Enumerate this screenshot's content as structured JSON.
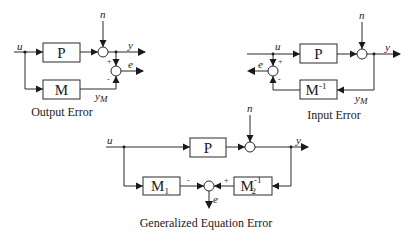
{
  "diagrams": [
    {
      "caption": "Output Error",
      "blocks": {
        "plant": "P",
        "model": "M"
      },
      "signals": {
        "input": "u",
        "noise": "n",
        "output": "y",
        "error": "e",
        "model_output": "y",
        "model_output_sub": "M"
      },
      "signs": {
        "plus": "+",
        "minus": "-"
      }
    },
    {
      "caption": "Input Error",
      "blocks": {
        "plant": "P",
        "inverse_model": "M",
        "inverse_sup": "-1"
      },
      "signals": {
        "input": "u",
        "noise": "n",
        "output": "y",
        "error": "e",
        "model_output": "y",
        "model_output_sub": "M"
      },
      "signs": {
        "plus": "+",
        "minus": "-"
      }
    },
    {
      "caption": "Generalized Equation Error",
      "blocks": {
        "plant": "P",
        "m1": "M",
        "m1_sub": "1",
        "m2": "M",
        "m2_sub": "2",
        "m2_sup": "-1"
      },
      "signals": {
        "input": "u",
        "noise": "n",
        "output": "y",
        "error": "e"
      },
      "signs": {
        "plus": "+",
        "minus": "-"
      }
    }
  ]
}
